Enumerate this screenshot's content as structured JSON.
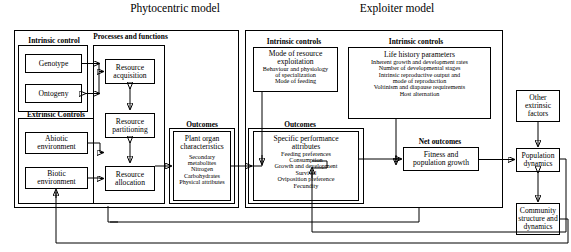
{
  "titles": {
    "phytocentric": "Phytocentric model",
    "exploiter": "Exploiter model"
  },
  "headings": {
    "intrinsic_control": "Intrinsic control",
    "processes_functions": "Processes and functions",
    "extrinsic_controls": "Extrinsic Controls",
    "outcomes_plant": "Outcomes",
    "intrinsic_controls_mode": "Intrinsic controls",
    "intrinsic_controls_life": "Intrinsic controls",
    "outcomes_exploiter": "Outcomes",
    "net_outcomes": "Net outcomes"
  },
  "nodes": {
    "genotype": {
      "title": "Genotype",
      "lines": []
    },
    "ontogeny": {
      "title": "Ontogeny",
      "lines": []
    },
    "abiotic": {
      "title": "Abiotic\nenvironment",
      "lines": []
    },
    "biotic": {
      "title": "Biotic\nenvironment",
      "lines": []
    },
    "resource_acquisition": {
      "title": "Resource\nacquisition",
      "lines": []
    },
    "resource_partitioning": {
      "title": "Resource\npartitioning",
      "lines": []
    },
    "resource_allocation": {
      "title": "Resource\nallocation",
      "lines": []
    },
    "plant_organ": {
      "title": "Plant organ\ncharacteristics",
      "lines": [
        "Secondary",
        "metabolites",
        "Nitrogen",
        "Carbohydrates",
        "Physical attributes"
      ]
    },
    "mode_resource": {
      "title": "Mode of resource\nexploitation",
      "lines": [
        "Behaviour and physiology",
        "of specialization",
        "Mode of feeding"
      ]
    },
    "life_history": {
      "title": "Life history parameters",
      "lines": [
        "Inherent growth and development rates",
        "Number of developmental stages",
        "Intrinsic reproductive output and",
        "mode of reproduction",
        "Voltinism and diapause requirements",
        "Host alternation"
      ]
    },
    "specific_performance": {
      "title": "Specific performance\nattributes",
      "lines": [
        "Feeding preferences",
        "Consumption",
        "Growth and development",
        "Survival",
        "Oviposition preference",
        "Fecundity"
      ]
    },
    "fitness": {
      "title": "Fitness and\npopulation growth",
      "lines": []
    },
    "other_extrinsic": {
      "title": "Other\nextrinsic\nfactors",
      "lines": []
    },
    "population_dynamics": {
      "title": "Population\ndynamics",
      "lines": []
    },
    "community": {
      "title": "Community\nstructure and\ndynamics",
      "lines": []
    }
  },
  "colors": {
    "stroke": "#000000",
    "background": "#ffffff",
    "text": "#000000"
  }
}
